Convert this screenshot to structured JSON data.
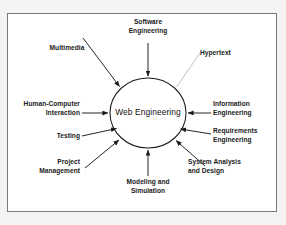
{
  "figure": {
    "frame_color": "#7a7a78",
    "background_color": "#ffffff",
    "page_background": "#f4f4f2",
    "line_color": "#1a1a1a",
    "faint_line_color": "#b9b9b9"
  },
  "center": {
    "label": "Web Engineering",
    "shape": "ellipse"
  },
  "nodes": [
    {
      "id": "software-engineering",
      "label": "Software\nEngineering",
      "align": "c",
      "connector": "arrow"
    },
    {
      "id": "multimedia",
      "label": "Multimedia",
      "align": "c",
      "connector": "arrow"
    },
    {
      "id": "hypertext",
      "label": "Hypertext",
      "align": "l",
      "connector": "line"
    },
    {
      "id": "human-computer-interaction",
      "label": "Human-Computer\nInteraction",
      "align": "r",
      "connector": "arrow"
    },
    {
      "id": "information-engineering",
      "label": "Information\nEngineering",
      "align": "l",
      "connector": "arrow"
    },
    {
      "id": "testing",
      "label": "Testing",
      "align": "r",
      "connector": "arrow"
    },
    {
      "id": "requirements-engineering",
      "label": "Requirements\nEngineering",
      "align": "l",
      "connector": "arrow"
    },
    {
      "id": "project-management",
      "label": "Project\nManagement",
      "align": "r",
      "connector": "arrow"
    },
    {
      "id": "system-analysis-and-design",
      "label": "System Analysis\nand Design",
      "align": "l",
      "connector": "arrow"
    },
    {
      "id": "modeling-and-simulation",
      "label": "Modeling and\nSimulation",
      "align": "c",
      "connector": "arrow"
    }
  ]
}
